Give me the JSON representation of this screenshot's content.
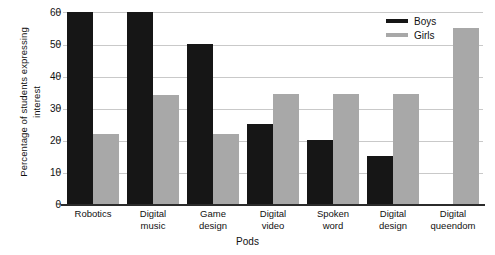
{
  "chart_data": {
    "type": "bar",
    "title": "",
    "xlabel": "Pods",
    "ylabel": "Percentage of students expressing\ninterest",
    "ylim": [
      0,
      60
    ],
    "yticks": [
      0,
      10,
      20,
      30,
      40,
      50,
      60
    ],
    "grid": true,
    "legend_position": "top-right",
    "categories": [
      "Robotics",
      "Digital\nmusic",
      "Game\ndesign",
      "Digital\nvideo",
      "Spoken\nword",
      "Digital\ndesign",
      "Digital\nqueendom"
    ],
    "series": [
      {
        "name": "Boys",
        "color": "#161616",
        "values": [
          60,
          60,
          50,
          25,
          20,
          15,
          0
        ]
      },
      {
        "name": "Girls",
        "color": "#a8a8a8",
        "values": [
          22,
          34,
          22,
          34.5,
          34.5,
          34.5,
          55
        ]
      }
    ]
  }
}
